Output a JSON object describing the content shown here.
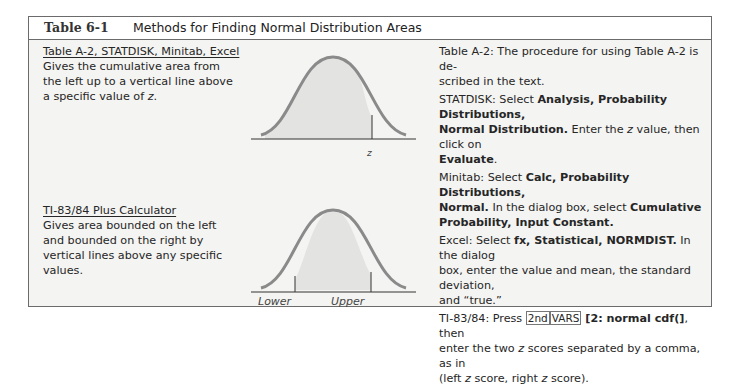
{
  "header": {
    "table_number": "Table 6-1",
    "title": "Methods for Finding Normal Distribution Areas"
  },
  "rows": [
    {
      "method_heading": "Table A-2, STATDISK, Minitab, Excel",
      "description_lines": [
        "Gives the cumulative area from",
        "the left up to a vertical line above",
        "a specific value of "
      ],
      "description_var": "z",
      "description_end": ".",
      "figure": {
        "type": "normal-curve-left-area",
        "label": "z"
      }
    },
    {
      "method_heading": "TI-83/84 Plus Calculator",
      "description_lines": [
        "Gives area bounded on the left",
        "and bounded on the right by",
        "vertical lines above any specific",
        "values."
      ],
      "figure": {
        "type": "normal-curve-between",
        "labels": [
          "Lower",
          "Upper"
        ]
      }
    }
  ],
  "instructions": {
    "table_a2": {
      "prefix": "Table A-2: The procedure for using Table A-2 is de-",
      "line2": "scribed in the text."
    },
    "statdisk": {
      "prefix": "STATDISK: Select ",
      "bold1": "Analysis, Probability Distributions,",
      "bold2": "Normal Distribution.",
      "mid": " Enter the ",
      "var": "z",
      "mid2": " value, then click on",
      "bold3": "Evaluate",
      "end": "."
    },
    "minitab": {
      "prefix": "Minitab: Select ",
      "bold1": "Calc, Probability Distributions,",
      "bold2": "Normal.",
      "mid": " In the dialog box, select ",
      "bold3": "Cumulative",
      "bold4": "Probability, Input Constant."
    },
    "excel": {
      "prefix": "Excel: Select ",
      "bold1": "fx, Statistical, NORMDIST.",
      "mid": " In the dialog",
      "line2": "box, enter the value and mean, the standard deviation,",
      "line3": "and “true.”"
    },
    "ti": {
      "prefix": "TI-83/84: Press ",
      "key1": "2nd",
      "key2": "VARS",
      "bold1": " [2: normal cdf(]",
      "mid": ", then",
      "line2a": "enter the two ",
      "var": "z",
      "line2b": " scores separated by a comma, as in",
      "line3a": "(left ",
      "line3b": " score, right ",
      "line3c": " score)."
    }
  }
}
